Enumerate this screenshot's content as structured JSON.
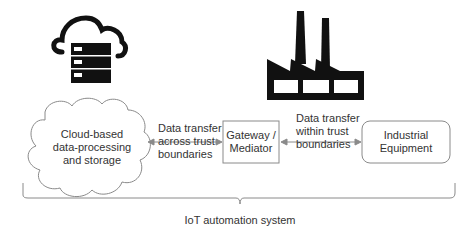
{
  "diagram": {
    "nodes": {
      "cloud": {
        "label_lines": [
          "Cloud-based",
          "data-processing",
          "and storage"
        ],
        "icon": "cloud-server-icon"
      },
      "gateway": {
        "label_lines": [
          "Gateway /",
          "Mediator"
        ]
      },
      "equipment": {
        "label_lines": [
          "Industrial",
          "Equipment"
        ],
        "icon": "factory-icon"
      }
    },
    "edges": {
      "cloud_gateway": {
        "label_lines": [
          "Data transfer",
          "across trust",
          "boundaries"
        ]
      },
      "gateway_equipment": {
        "label_lines": [
          "Data transfer",
          "within trust",
          "boundaries"
        ]
      }
    },
    "brace": {
      "label": "IoT automation system"
    },
    "colors": {
      "stroke": "#8a8a8a",
      "icon": "#111111",
      "text": "#333333"
    }
  }
}
